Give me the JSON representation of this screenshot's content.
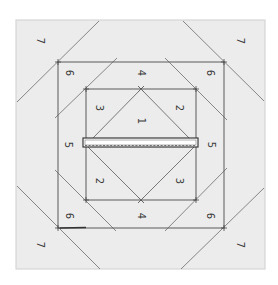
{
  "diagram": {
    "colors": {
      "background": "#ffffff",
      "block_fill": "#ececec",
      "block_border": "#d6d6d6",
      "line": "#6a6a6a",
      "bar_outline": "#4a4a4a",
      "label": "#3a3a3a"
    },
    "regions": {
      "outer_square": {
        "x1": 16,
        "y1": 20,
        "x2": 265,
        "y2": 269
      },
      "middle_square": {
        "x1": 58,
        "y1": 62,
        "x2": 224,
        "y2": 228
      },
      "inner_square": {
        "x1": 86,
        "y1": 89,
        "x2": 196,
        "y2": 200
      },
      "center_bar": {
        "x1": 83,
        "y1": 138,
        "x2": 198,
        "y2": 147
      }
    },
    "labels": [
      {
        "id": "top-left-7",
        "text": "7",
        "x": 40,
        "y": 41
      },
      {
        "id": "top-right-7",
        "text": "7",
        "x": 240,
        "y": 41
      },
      {
        "id": "bottom-left-7",
        "text": "7",
        "x": 40,
        "y": 245
      },
      {
        "id": "bottom-right-7",
        "text": "7",
        "x": 240,
        "y": 245
      },
      {
        "id": "top-left-6",
        "text": "6",
        "x": 69,
        "y": 73
      },
      {
        "id": "top-right-6",
        "text": "6",
        "x": 210,
        "y": 73
      },
      {
        "id": "bottom-left-6",
        "text": "6",
        "x": 69,
        "y": 216
      },
      {
        "id": "bottom-right-6",
        "text": "6",
        "x": 210,
        "y": 216
      },
      {
        "id": "top-4",
        "text": "4",
        "x": 141,
        "y": 73
      },
      {
        "id": "bottom-4",
        "text": "4",
        "x": 141,
        "y": 216
      },
      {
        "id": "left-5",
        "text": "5",
        "x": 68,
        "y": 145
      },
      {
        "id": "right-5",
        "text": "5",
        "x": 211,
        "y": 145
      },
      {
        "id": "upper-left-3",
        "text": "3",
        "x": 99,
        "y": 108
      },
      {
        "id": "upper-right-2",
        "text": "2",
        "x": 179,
        "y": 108
      },
      {
        "id": "center-1",
        "text": "1",
        "x": 141,
        "y": 121
      },
      {
        "id": "lower-left-2",
        "text": "2",
        "x": 99,
        "y": 181
      },
      {
        "id": "lower-right-3",
        "text": "3",
        "x": 179,
        "y": 181
      }
    ]
  }
}
